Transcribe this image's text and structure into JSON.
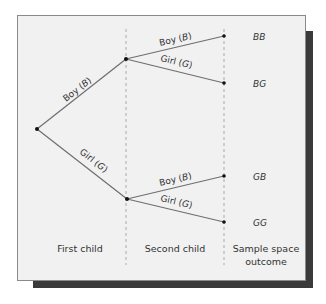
{
  "diagram": {
    "type": "probability-tree",
    "branches": {
      "first": [
        {
          "label": "Boy",
          "symbol": "B"
        },
        {
          "label": "Girl",
          "symbol": "G"
        }
      ],
      "second_upper": [
        {
          "label": "Boy",
          "symbol": "B"
        },
        {
          "label": "Girl",
          "symbol": "G"
        }
      ],
      "second_lower": [
        {
          "label": "Boy",
          "symbol": "B"
        },
        {
          "label": "Girl",
          "symbol": "G"
        }
      ]
    },
    "outcomes": [
      "BB",
      "BG",
      "GB",
      "GG"
    ],
    "columns": {
      "first": "First child",
      "second": "Second child",
      "outcome_line1": "Sample space",
      "outcome_line2": "outcome"
    }
  },
  "colors": {
    "panel": "#f1f1f1",
    "border": "#8a8a8a",
    "shadow": "#3a3a3a",
    "line": "#6e6e6e",
    "text": "#333333"
  }
}
